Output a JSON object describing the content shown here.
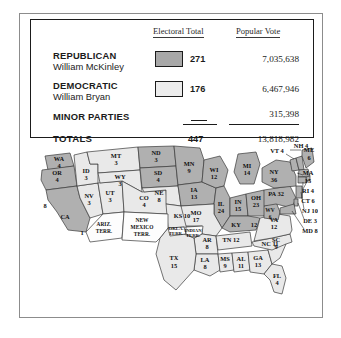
{
  "table": {
    "headers": {
      "electoral": "Electoral Total",
      "popular": "Popular Vote"
    },
    "rows": [
      {
        "party": "REPUBLICAN",
        "candidate": "William McKinley",
        "electoral": "271",
        "popular": "7,035,638",
        "swatch": "dark-gray"
      },
      {
        "party": "DEMOCRATIC",
        "candidate": "William Bryan",
        "electoral": "176",
        "popular": "6,467,946",
        "swatch": "light-gray"
      },
      {
        "party": "MINOR PARTIES",
        "candidate": "",
        "electoral": "—",
        "popular": "315,398",
        "swatch": "none"
      }
    ],
    "totals": {
      "label": "TOTALS",
      "electoral": "447",
      "popular": "13,818,982"
    }
  },
  "colors": {
    "republican_fill": "#b0b0b0",
    "democratic_fill": "#e9e9e9",
    "territory_fill": "#fdfdfd",
    "outline": "#3a3a3a",
    "frame": "#8c8c8c",
    "table_border": "#1b1b1b",
    "text": "#1b1b1b"
  },
  "map": {
    "states": [
      {
        "abbr": "WA",
        "votes": "4",
        "party": "republican"
      },
      {
        "abbr": "OR",
        "votes": "4",
        "party": "republican"
      },
      {
        "abbr": "CA",
        "votes": "8",
        "party": "republican"
      },
      {
        "abbr": "NV",
        "votes": "3",
        "party": "democratic"
      },
      {
        "abbr": "ID",
        "votes": "3",
        "party": "democratic"
      },
      {
        "abbr": "UT",
        "votes": "3",
        "party": "democratic"
      },
      {
        "abbr": "MT",
        "votes": "3",
        "party": "democratic"
      },
      {
        "abbr": "WY",
        "votes": "3",
        "party": "democratic"
      },
      {
        "abbr": "CO",
        "votes": "4",
        "party": "democratic"
      },
      {
        "abbr": "ND",
        "votes": "3",
        "party": "republican"
      },
      {
        "abbr": "SD",
        "votes": "4",
        "party": "republican"
      },
      {
        "abbr": "NE",
        "votes": "8",
        "party": "democratic"
      },
      {
        "abbr": "KS",
        "votes": "10",
        "party": "democratic"
      },
      {
        "abbr": "MN",
        "votes": "9",
        "party": "republican"
      },
      {
        "abbr": "IA",
        "votes": "13",
        "party": "republican"
      },
      {
        "abbr": "MO",
        "votes": "17",
        "party": "democratic"
      },
      {
        "abbr": "AR",
        "votes": "8",
        "party": "democratic"
      },
      {
        "abbr": "LA",
        "votes": "8",
        "party": "democratic"
      },
      {
        "abbr": "TX",
        "votes": "15",
        "party": "democratic"
      },
      {
        "abbr": "MS",
        "votes": "9",
        "party": "democratic"
      },
      {
        "abbr": "AL",
        "votes": "11",
        "party": "democratic"
      },
      {
        "abbr": "GA",
        "votes": "13",
        "party": "democratic"
      },
      {
        "abbr": "FL",
        "votes": "4",
        "party": "democratic"
      },
      {
        "abbr": "WI",
        "votes": "12",
        "party": "republican"
      },
      {
        "abbr": "IL",
        "votes": "24",
        "party": "republican"
      },
      {
        "abbr": "MI",
        "votes": "14",
        "party": "republican"
      },
      {
        "abbr": "IN",
        "votes": "15",
        "party": "republican"
      },
      {
        "abbr": "OH",
        "votes": "23",
        "party": "republican"
      },
      {
        "abbr": "KY",
        "votes": "12",
        "party": "republican"
      },
      {
        "abbr": "TN",
        "votes": "12",
        "party": "democratic"
      },
      {
        "abbr": "SC",
        "votes": "9",
        "party": "democratic"
      },
      {
        "abbr": "NC",
        "votes": "11",
        "party": "democratic"
      },
      {
        "abbr": "VA",
        "votes": "12",
        "party": "democratic"
      },
      {
        "abbr": "WV",
        "votes": "6",
        "party": "republican"
      },
      {
        "abbr": "PA",
        "votes": "32",
        "party": "republican"
      },
      {
        "abbr": "NY",
        "votes": "36",
        "party": "republican"
      },
      {
        "abbr": "VT",
        "votes": "4",
        "party": "republican"
      },
      {
        "abbr": "NH",
        "votes": "4",
        "party": "republican"
      },
      {
        "abbr": "ME",
        "votes": "6",
        "party": "republican"
      },
      {
        "abbr": "MA",
        "votes": "15",
        "party": "republican"
      },
      {
        "abbr": "RI",
        "votes": "4",
        "party": "republican"
      },
      {
        "abbr": "CT",
        "votes": "6",
        "party": "republican"
      },
      {
        "abbr": "NJ",
        "votes": "10",
        "party": "republican"
      },
      {
        "abbr": "DE",
        "votes": "3",
        "party": "republican"
      },
      {
        "abbr": "MD",
        "votes": "8",
        "party": "republican"
      }
    ],
    "territories": [
      {
        "name": "ARIZ. TERR.",
        "line1": "ARIZ.",
        "line2": "TERR."
      },
      {
        "name": "NEW MEXICO TERR.",
        "line1": "NEW",
        "line2": "MEXICO",
        "line3": "TERR."
      },
      {
        "name": "OKLA. TERR.",
        "line1": "OKLA.",
        "line2": "TERR."
      },
      {
        "name": "INDIAN TERR.",
        "line1": "INDIAN",
        "line2": "TERR."
      }
    ],
    "side_labels": {
      "ma": "MA",
      "ma_votes": "15",
      "ri": "RI 4",
      "ct": "CT 6",
      "nj": "NJ 10",
      "de": "DE 3",
      "md": "MD 8",
      "nh": "NH 4",
      "vt": "VT 4",
      "me": "ME",
      "me_votes": "6",
      "ny": "NY",
      "ny_votes": "36",
      "pa": "PA 32",
      "ks": "KS 10",
      "tn": "TN 12",
      "nc": "NC 11",
      "ky": "KY",
      "ky_votes": "12",
      "va": "VA",
      "va_votes": "12",
      "wv": "WV",
      "wv_votes": "6",
      "ca_votes": "8",
      "az_votes": "1"
    }
  }
}
